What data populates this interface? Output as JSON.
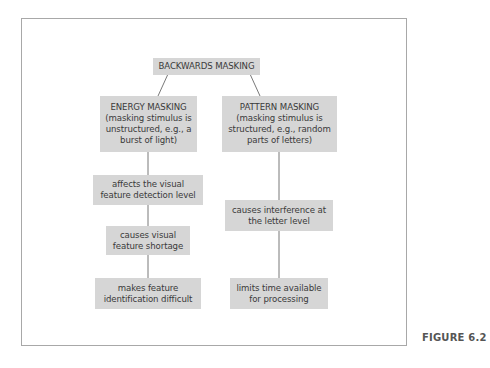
{
  "diagram": {
    "root": {
      "label": "BACKWARDS MASKING"
    },
    "branches": [
      {
        "title": "ENERGY MASKING",
        "lines": [
          "ENERGY MASKING",
          "(masking stimulus is",
          "unstructured, e.g., a",
          "burst of light)"
        ],
        "steps": [
          {
            "lines": [
              "affects the visual",
              "feature detection level"
            ]
          },
          {
            "lines": [
              "causes visual",
              "feature shortage"
            ]
          },
          {
            "lines": [
              "makes feature",
              "identification difficult"
            ]
          }
        ]
      },
      {
        "title": "PATTERN MASKING",
        "lines": [
          "PATTERN MASKING",
          "(masking stimulus is",
          "structured, e.g., random",
          "parts of letters)"
        ],
        "steps": [
          {
            "lines": [
              "causes interference at",
              "the letter level"
            ]
          },
          {
            "lines": [
              "limits time available",
              "for processing"
            ]
          }
        ]
      }
    ]
  },
  "caption": "FIGURE 6.2",
  "colors": {
    "box_fill": "#d6d6d6",
    "frame": "#a8a8a8",
    "line": "#555555",
    "text": "#3a3a3a"
  }
}
